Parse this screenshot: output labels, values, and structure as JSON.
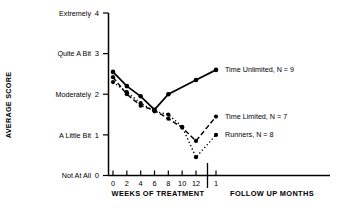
{
  "chart_data": {
    "type": "line",
    "title": "",
    "xlabel": "WEEKS OF TREATMENT",
    "xlabel2": "FOLLOW UP MONTHS",
    "ylabel": "AVERAGE SCORE",
    "ylim": [
      0,
      4
    ],
    "xlim": [
      0,
      12
    ],
    "grid": false,
    "legend_position": "inline-right",
    "y_ticks": [
      {
        "value": 0,
        "num": "0",
        "label": "Not At All"
      },
      {
        "value": 1,
        "num": "1",
        "label": "A Little Bit"
      },
      {
        "value": 2,
        "num": "2",
        "label": "Moderately"
      },
      {
        "value": 3,
        "num": "3",
        "label": "Quite A Bit"
      },
      {
        "value": 4,
        "num": "4",
        "label": "Extremely"
      }
    ],
    "x_ticks": [
      {
        "value": 0,
        "label": "0"
      },
      {
        "value": 2,
        "label": "2"
      },
      {
        "value": 4,
        "label": "4"
      },
      {
        "value": 6,
        "label": "6"
      },
      {
        "value": 8,
        "label": "8"
      },
      {
        "value": 10,
        "label": "10"
      },
      {
        "value": 12,
        "label": "12"
      }
    ],
    "followup_ticks": [
      {
        "value": 1,
        "label": "1"
      }
    ],
    "series": [
      {
        "name": "Time Unlimited",
        "n": 9,
        "legend_label": "Time Unlimited, N = 9",
        "style": "solid",
        "x": [
          0,
          2,
          4,
          6,
          8,
          12
        ],
        "followup_x": [
          1
        ],
        "values": [
          2.55,
          2.2,
          1.95,
          1.62,
          2.0,
          2.35
        ],
        "followup_values": [
          2.6
        ]
      },
      {
        "name": "Time Limited",
        "n": 7,
        "legend_label": "Time Limited, N = 7",
        "style": "dashed",
        "x": [
          0,
          2,
          4,
          6,
          8,
          10,
          12
        ],
        "followup_x": [
          1
        ],
        "values": [
          2.42,
          2.0,
          1.72,
          1.6,
          1.4,
          1.18,
          0.85
        ],
        "followup_values": [
          1.45
        ]
      },
      {
        "name": "Runners",
        "n": 8,
        "legend_label": "Runners, N = 8",
        "style": "dotted",
        "x": [
          0,
          2,
          4,
          6,
          8,
          10,
          12
        ],
        "followup_x": [
          1
        ],
        "values": [
          2.3,
          2.05,
          1.78,
          1.58,
          1.5,
          1.2,
          0.45
        ],
        "followup_values": [
          1.0
        ]
      }
    ]
  }
}
